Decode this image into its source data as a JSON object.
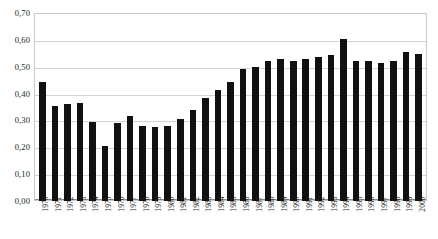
{
  "chart_data": {
    "type": "bar",
    "title": "",
    "subtitle": "",
    "xlabel": "",
    "ylabel": "",
    "ylim": [
      0.0,
      0.7
    ],
    "ytick_step": 0.1,
    "ytick_labels": [
      "0,70",
      "0,60",
      "0,50",
      "0,40",
      "0,30",
      "0,20",
      "0,10",
      "0,00"
    ],
    "ytick_values": [
      0.7,
      0.6,
      0.5,
      0.4,
      0.3,
      0.2,
      0.1,
      0.0
    ],
    "decimal_separator": ",",
    "grid": true,
    "grid_axis": "y",
    "legend": "none",
    "bar_color": "#111111",
    "grid_color": "#d4d4d4",
    "frame_color": "#c9c9c9",
    "categories": [
      "1970",
      "1971",
      "1972",
      "1973",
      "1974",
      "1975",
      "1976",
      "1977",
      "1978",
      "1979",
      "1980",
      "1981",
      "1982",
      "1983",
      "1984",
      "1985",
      "1986",
      "1987",
      "1988",
      "1989",
      "1990",
      "1991",
      "1992",
      "1993",
      "1994",
      "1995",
      "1996",
      "1997",
      "1998",
      "1999",
      "2000"
    ],
    "values": [
      0.445,
      0.355,
      0.36,
      0.365,
      0.295,
      0.205,
      0.29,
      0.315,
      0.28,
      0.275,
      0.28,
      0.305,
      0.34,
      0.385,
      0.415,
      0.445,
      0.49,
      0.5,
      0.52,
      0.53,
      0.52,
      0.53,
      0.535,
      0.545,
      0.603,
      0.52,
      0.52,
      0.515,
      0.52,
      0.555,
      0.548
    ]
  }
}
